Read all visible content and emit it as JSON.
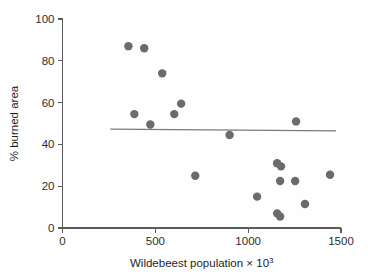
{
  "chart_data": {
    "type": "scatter",
    "title": "",
    "xlabel": "Wildebeest population × 10³",
    "xlabel_base": "Wildebeest population × 10",
    "xlabel_exponent": "3",
    "ylabel": "% burned area",
    "xlim": [
      0,
      1500
    ],
    "ylim": [
      0,
      100
    ],
    "xticks": [
      0,
      500,
      1000,
      1500
    ],
    "xtick_labels": [
      "0",
      "500",
      "1000",
      "1500"
    ],
    "yticks": [
      0,
      20,
      40,
      60,
      80,
      100
    ],
    "ytick_labels": [
      "0",
      "20",
      "40",
      "60",
      "80",
      "100"
    ],
    "grid": false,
    "legend": "none",
    "marker_color": "#6b6b6b",
    "marker_size": 4.2,
    "axis_color": "#5b5b5b",
    "points": [
      {
        "x": 355,
        "y": 87.0
      },
      {
        "x": 440,
        "y": 86.0
      },
      {
        "x": 537,
        "y": 74.0
      },
      {
        "x": 387,
        "y": 54.5
      },
      {
        "x": 473,
        "y": 49.5
      },
      {
        "x": 602,
        "y": 54.5
      },
      {
        "x": 639,
        "y": 59.5
      },
      {
        "x": 900,
        "y": 44.5
      },
      {
        "x": 715,
        "y": 25.0
      },
      {
        "x": 1048,
        "y": 15.0
      },
      {
        "x": 1156,
        "y": 31.0
      },
      {
        "x": 1177,
        "y": 29.5
      },
      {
        "x": 1172,
        "y": 22.5
      },
      {
        "x": 1253,
        "y": 22.5
      },
      {
        "x": 1258,
        "y": 51.0
      },
      {
        "x": 1156,
        "y": 7.0
      },
      {
        "x": 1172,
        "y": 5.5
      },
      {
        "x": 1306,
        "y": 11.5
      },
      {
        "x": 1441,
        "y": 25.5
      }
    ],
    "fit_line": {
      "type": "linear-regression",
      "x_start": 258,
      "y_start": 47.3,
      "x_end": 1473,
      "y_end": 46.5,
      "color": "#7a7a7a"
    }
  }
}
